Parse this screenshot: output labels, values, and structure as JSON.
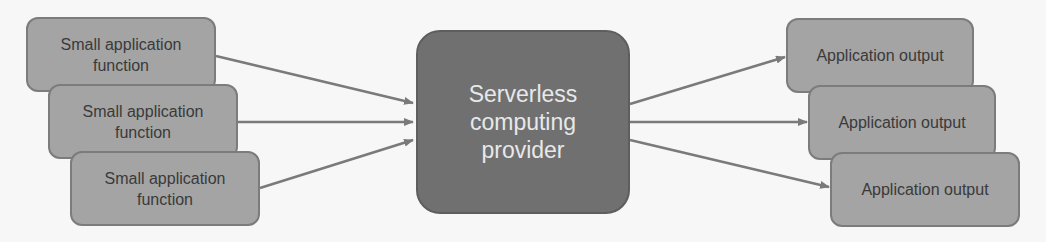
{
  "diagram": {
    "inputs": [
      {
        "label": "Small application\nfunction"
      },
      {
        "label": "Small application\nfunction"
      },
      {
        "label": "Small application\nfunction"
      }
    ],
    "center": {
      "label": "Serverless\ncomputing\nprovider"
    },
    "outputs": [
      {
        "label": "Application output"
      },
      {
        "label": "Application output"
      },
      {
        "label": "Application output"
      }
    ],
    "colors": {
      "background": "#f7f7f7",
      "box_fill": "#a4a4a4",
      "box_border": "#7c7c7c",
      "center_fill": "#707070",
      "arrow": "#7a7a7a"
    }
  }
}
